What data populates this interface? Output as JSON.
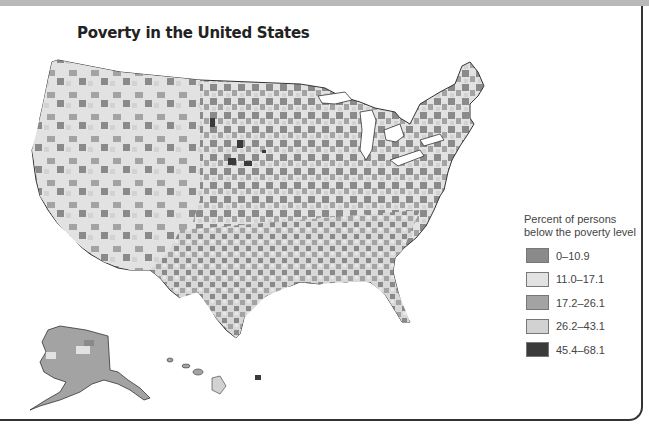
{
  "title": "Poverty in the United States",
  "legend": {
    "title_line1": "Percent of persons",
    "title_line2": "below the poverty level",
    "items": [
      {
        "label": "0–10.9",
        "color": "#8a8a8a"
      },
      {
        "label": "11.0–17.1",
        "color": "#e2e2e2"
      },
      {
        "label": "17.2–26.1",
        "color": "#a3a3a3"
      },
      {
        "label": "26.2–43.1",
        "color": "#d2d2d2"
      },
      {
        "label": "45.4–68.1",
        "color": "#3a3a3a"
      }
    ]
  },
  "map": {
    "regions": [
      "Contiguous United States",
      "Alaska",
      "Hawaii"
    ]
  }
}
